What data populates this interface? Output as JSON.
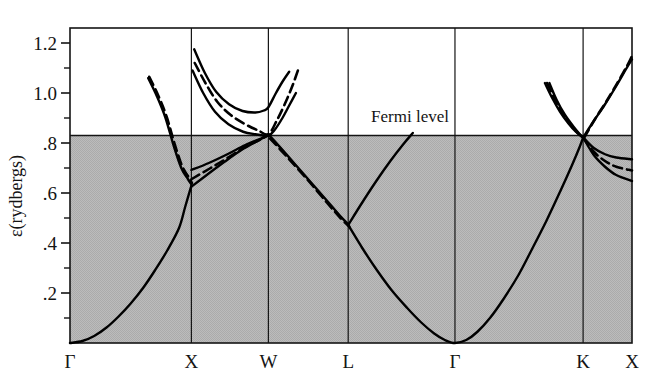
{
  "figure": {
    "kind": "band-structure-plot",
    "background": "#ffffff",
    "frame_color": "#141414",
    "curve_color": "#000000",
    "shaded_region_color": "#b9b9b9"
  },
  "axes": {
    "y_title": "ε(rydbergs)",
    "y_major_labels": [
      "1.2",
      "1.0",
      ".8",
      ".6",
      ".4",
      ".2"
    ],
    "y_major_values": [
      1.2,
      1.0,
      0.8,
      0.6,
      0.4,
      0.2
    ],
    "y_minor_values": [
      1.1,
      0.9,
      0.7,
      0.5,
      0.3,
      0.1
    ],
    "y_min": 0.0,
    "y_max": 1.26,
    "x_labels": [
      "Γ",
      "X",
      "W",
      "L",
      "Γ",
      "K",
      "X"
    ]
  },
  "annotations": [
    {
      "name": "fermi-level-label",
      "text": "Fermi level",
      "x_frac": 0.605,
      "energy": 0.885
    }
  ],
  "chart_data": {
    "type": "line",
    "title": "",
    "xlabel": "",
    "ylabel": "ε(rydbergs)",
    "ylim": [
      0.0,
      1.26
    ],
    "grid": true,
    "legend": "none",
    "fermi_level": 0.83,
    "shaded_below_fermi": true,
    "kpoints": [
      {
        "label": "Γ",
        "x": 0.0
      },
      {
        "label": "X",
        "x": 0.216
      },
      {
        "label": "W",
        "x": 0.353
      },
      {
        "label": "L",
        "x": 0.495
      },
      {
        "label": "Γ",
        "x": 0.685
      },
      {
        "label": "K",
        "x": 0.913
      },
      {
        "label": "X",
        "x": 1.0
      }
    ],
    "series": [
      {
        "name": "valence-band-gamma-x",
        "style": "solid",
        "points": [
          [
            0.0,
            0.0
          ],
          [
            0.022,
            0.008
          ],
          [
            0.043,
            0.028
          ],
          [
            0.065,
            0.062
          ],
          [
            0.086,
            0.105
          ],
          [
            0.108,
            0.158
          ],
          [
            0.13,
            0.22
          ],
          [
            0.151,
            0.29
          ],
          [
            0.173,
            0.37
          ],
          [
            0.194,
            0.46
          ],
          [
            0.205,
            0.545
          ],
          [
            0.216,
            0.63
          ]
        ]
      },
      {
        "name": "upper-band-x-descending-solid",
        "style": "solid",
        "points": [
          [
            0.139,
            1.06
          ],
          [
            0.155,
            0.985
          ],
          [
            0.17,
            0.9
          ],
          [
            0.185,
            0.785
          ],
          [
            0.198,
            0.7
          ],
          [
            0.21,
            0.655
          ],
          [
            0.216,
            0.635
          ]
        ]
      },
      {
        "name": "upper-band-x-descending-dashed",
        "style": "dashed",
        "points": [
          [
            0.141,
            1.065
          ],
          [
            0.157,
            0.99
          ],
          [
            0.172,
            0.905
          ],
          [
            0.187,
            0.79
          ],
          [
            0.2,
            0.705
          ],
          [
            0.212,
            0.66
          ],
          [
            0.217,
            0.64
          ]
        ]
      },
      {
        "name": "band-x-to-w-lower-solid",
        "style": "solid",
        "points": [
          [
            0.216,
            0.625
          ],
          [
            0.245,
            0.675
          ],
          [
            0.275,
            0.725
          ],
          [
            0.305,
            0.772
          ],
          [
            0.335,
            0.81
          ],
          [
            0.353,
            0.832
          ]
        ]
      },
      {
        "name": "band-x-to-w-upper-solid",
        "style": "solid",
        "points": [
          [
            0.216,
            0.692
          ],
          [
            0.247,
            0.72
          ],
          [
            0.28,
            0.755
          ],
          [
            0.312,
            0.792
          ],
          [
            0.34,
            0.818
          ],
          [
            0.353,
            0.832
          ]
        ]
      },
      {
        "name": "band-x-to-w-dashed",
        "style": "dashed",
        "points": [
          [
            0.216,
            0.655
          ],
          [
            0.248,
            0.697
          ],
          [
            0.28,
            0.74
          ],
          [
            0.312,
            0.785
          ],
          [
            0.34,
            0.815
          ],
          [
            0.353,
            0.832
          ]
        ]
      },
      {
        "name": "conduction-band-x-w-l-solid-outer",
        "style": "solid",
        "points": [
          [
            0.221,
            1.175
          ],
          [
            0.24,
            1.08
          ],
          [
            0.26,
            1.005
          ],
          [
            0.283,
            0.955
          ],
          [
            0.307,
            0.928
          ],
          [
            0.33,
            0.922
          ],
          [
            0.345,
            0.93
          ],
          [
            0.353,
            0.943
          ],
          [
            0.366,
            0.998
          ],
          [
            0.378,
            1.045
          ],
          [
            0.39,
            1.085
          ]
        ]
      },
      {
        "name": "conduction-band-x-w-l-solid-inner",
        "style": "solid",
        "points": [
          [
            0.218,
            1.09
          ],
          [
            0.237,
            1.0
          ],
          [
            0.258,
            0.925
          ],
          [
            0.282,
            0.875
          ],
          [
            0.308,
            0.845
          ],
          [
            0.33,
            0.835
          ],
          [
            0.353,
            0.83
          ],
          [
            0.365,
            0.855
          ],
          [
            0.378,
            0.9
          ],
          [
            0.39,
            0.95
          ],
          [
            0.402,
            1.0
          ]
        ]
      },
      {
        "name": "conduction-band-x-w-l-dashed",
        "style": "dashed",
        "points": [
          [
            0.222,
            1.12
          ],
          [
            0.241,
            1.04
          ],
          [
            0.262,
            0.965
          ],
          [
            0.286,
            0.912
          ],
          [
            0.312,
            0.875
          ],
          [
            0.335,
            0.85
          ],
          [
            0.353,
            0.835
          ],
          [
            0.368,
            0.89
          ],
          [
            0.382,
            0.955
          ],
          [
            0.396,
            1.03
          ],
          [
            0.407,
            1.1
          ]
        ]
      },
      {
        "name": "band-w-to-l-descending-solid",
        "style": "solid",
        "points": [
          [
            0.353,
            0.835
          ],
          [
            0.385,
            0.755
          ],
          [
            0.42,
            0.665
          ],
          [
            0.455,
            0.575
          ],
          [
            0.48,
            0.51
          ],
          [
            0.495,
            0.475
          ]
        ]
      },
      {
        "name": "band-w-to-l-descending-dashed",
        "style": "dashed",
        "points": [
          [
            0.356,
            0.818
          ],
          [
            0.388,
            0.74
          ],
          [
            0.423,
            0.652
          ],
          [
            0.457,
            0.562
          ],
          [
            0.482,
            0.498
          ],
          [
            0.497,
            0.466
          ]
        ]
      },
      {
        "name": "band-l-to-gamma-rising-solid",
        "style": "solid",
        "points": [
          [
            0.495,
            0.472
          ],
          [
            0.52,
            0.562
          ],
          [
            0.545,
            0.648
          ],
          [
            0.57,
            0.728
          ],
          [
            0.593,
            0.795
          ],
          [
            0.61,
            0.84
          ]
        ]
      },
      {
        "name": "valence-band-l-to-gamma-to-k",
        "style": "solid",
        "points": [
          [
            0.495,
            0.472
          ],
          [
            0.52,
            0.38
          ],
          [
            0.545,
            0.295
          ],
          [
            0.572,
            0.212
          ],
          [
            0.6,
            0.14
          ],
          [
            0.625,
            0.082
          ],
          [
            0.648,
            0.038
          ],
          [
            0.667,
            0.012
          ],
          [
            0.685,
            0.0
          ],
          [
            0.705,
            0.012
          ],
          [
            0.725,
            0.045
          ],
          [
            0.748,
            0.102
          ],
          [
            0.772,
            0.178
          ],
          [
            0.798,
            0.272
          ],
          [
            0.822,
            0.375
          ],
          [
            0.848,
            0.49
          ],
          [
            0.872,
            0.605
          ],
          [
            0.893,
            0.71
          ],
          [
            0.907,
            0.785
          ],
          [
            0.913,
            0.822
          ]
        ]
      },
      {
        "name": "band-k-to-x-upper-solid",
        "style": "solid",
        "points": [
          [
            0.913,
            0.822
          ],
          [
            0.932,
            0.78
          ],
          [
            0.952,
            0.755
          ],
          [
            0.972,
            0.742
          ],
          [
            1.0,
            0.735
          ]
        ]
      },
      {
        "name": "band-k-to-x-lower-solid",
        "style": "solid",
        "points": [
          [
            0.913,
            0.822
          ],
          [
            0.932,
            0.752
          ],
          [
            0.952,
            0.705
          ],
          [
            0.972,
            0.672
          ],
          [
            1.0,
            0.648
          ]
        ]
      },
      {
        "name": "band-k-to-x-dashed",
        "style": "dashed",
        "points": [
          [
            0.913,
            0.822
          ],
          [
            0.932,
            0.765
          ],
          [
            0.952,
            0.728
          ],
          [
            0.972,
            0.705
          ],
          [
            1.0,
            0.69
          ]
        ]
      },
      {
        "name": "band-gamma-k-rising-solid-left",
        "style": "solid",
        "points": [
          [
            0.845,
            1.04
          ],
          [
            0.858,
            0.98
          ],
          [
            0.872,
            0.925
          ],
          [
            0.887,
            0.878
          ],
          [
            0.9,
            0.845
          ],
          [
            0.913,
            0.822
          ]
        ]
      },
      {
        "name": "band-gamma-k-rising-solid-right",
        "style": "solid",
        "points": [
          [
            0.853,
            1.04
          ],
          [
            0.866,
            0.972
          ],
          [
            0.88,
            0.915
          ],
          [
            0.895,
            0.868
          ],
          [
            0.906,
            0.838
          ],
          [
            0.913,
            0.822
          ]
        ]
      },
      {
        "name": "band-gamma-k-rising-dashed",
        "style": "dashed",
        "points": [
          [
            0.849,
            1.04
          ],
          [
            0.862,
            0.976
          ],
          [
            0.876,
            0.92
          ],
          [
            0.891,
            0.873
          ],
          [
            0.903,
            0.841
          ],
          [
            0.913,
            0.822
          ]
        ]
      },
      {
        "name": "band-k-to-x-rising-solid",
        "style": "solid",
        "points": [
          [
            0.913,
            0.822
          ],
          [
            0.932,
            0.888
          ],
          [
            0.952,
            0.955
          ],
          [
            0.972,
            1.028
          ],
          [
            0.99,
            1.098
          ],
          [
            1.0,
            1.135
          ]
        ]
      },
      {
        "name": "band-k-to-x-rising-dashed",
        "style": "dashed",
        "points": [
          [
            0.915,
            0.822
          ],
          [
            0.934,
            0.895
          ],
          [
            0.954,
            0.965
          ],
          [
            0.974,
            1.04
          ],
          [
            0.992,
            1.112
          ],
          [
            1.0,
            1.148
          ]
        ]
      }
    ]
  }
}
